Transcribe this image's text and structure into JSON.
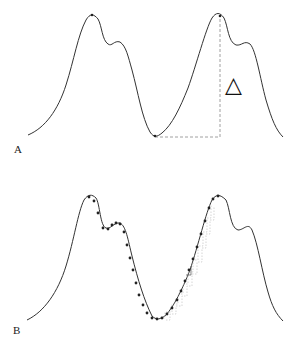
{
  "panels": [
    {
      "label": "A",
      "annotation": "△",
      "description": "Double-humped periodic curve; dashed right-angle from trough to second peak marks height difference"
    },
    {
      "label": "B",
      "description": "Same curve with dotted sample points along a path from first peak down through trough and up to second peak, with faint stepped staircase lines"
    }
  ],
  "colors": {
    "curve": "#333333",
    "dashed": "#888888",
    "points": "#222222",
    "staircase": "#bbbbbb"
  }
}
